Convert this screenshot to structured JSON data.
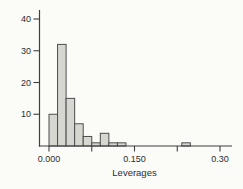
{
  "figure": {
    "background_color": "#fbfbf8",
    "axis_color": "#3f3f3f",
    "text_color": "#2d2d2d",
    "bar_fill_color": "#d7d7d1",
    "bar_stroke_color": "#4d4d4d"
  },
  "chart_data": {
    "type": "bar",
    "subtype": "histogram",
    "title": "",
    "xlabel": "Leverages",
    "ylabel": "",
    "xlim": [
      -0.018,
      0.321
    ],
    "ylim": [
      0,
      43
    ],
    "grid": false,
    "legend": null,
    "x_ticks": [
      {
        "value": 0.0,
        "label": "0.000"
      },
      {
        "value": 0.075,
        "label": ""
      },
      {
        "value": 0.15,
        "label": "0.150"
      },
      {
        "value": 0.225,
        "label": ""
      },
      {
        "value": 0.3,
        "label": "0.30"
      }
    ],
    "y_ticks": [
      {
        "value": 10,
        "label": "10"
      },
      {
        "value": 20,
        "label": "20"
      },
      {
        "value": 30,
        "label": "30"
      },
      {
        "value": 40,
        "label": "40"
      }
    ],
    "bins": [
      {
        "start": 0.0,
        "end": 0.015,
        "count": 10
      },
      {
        "start": 0.015,
        "end": 0.03,
        "count": 32
      },
      {
        "start": 0.03,
        "end": 0.045,
        "count": 15
      },
      {
        "start": 0.045,
        "end": 0.06,
        "count": 7
      },
      {
        "start": 0.06,
        "end": 0.075,
        "count": 3
      },
      {
        "start": 0.075,
        "end": 0.09,
        "count": 1
      },
      {
        "start": 0.09,
        "end": 0.105,
        "count": 4
      },
      {
        "start": 0.105,
        "end": 0.12,
        "count": 1
      },
      {
        "start": 0.12,
        "end": 0.135,
        "count": 1
      },
      {
        "start": 0.233,
        "end": 0.248,
        "count": 1
      }
    ]
  }
}
